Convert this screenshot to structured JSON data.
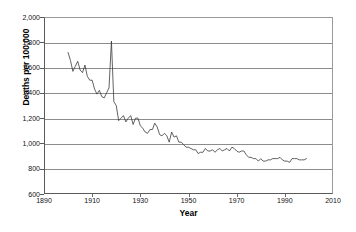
{
  "chart_data": {
    "type": "line",
    "title": "",
    "xlabel": "Year",
    "ylabel": "Deaths per 100,000",
    "xlim": [
      1890,
      2010
    ],
    "ylim": [
      600,
      2000
    ],
    "xticks": [
      1890,
      1910,
      1930,
      1950,
      1970,
      1990,
      2010
    ],
    "yticks": [
      600,
      800,
      1000,
      1200,
      1400,
      1600,
      1800,
      2000
    ],
    "ytick_labels": [
      "600",
      "800",
      "1,000",
      "1,200",
      "1,400",
      "1,600",
      "1,800",
      "2,000"
    ],
    "xtick_labels": [
      "1890",
      "1910",
      "1930",
      "1950",
      "1970",
      "1990",
      "2010"
    ],
    "grid": true,
    "grid_axis": "y",
    "legend": false,
    "legend_position": "none",
    "line_color": "#3a3a3a",
    "series": [
      {
        "name": "Deaths per 100,000",
        "x": [
          1900,
          1901,
          1902,
          1903,
          1904,
          1905,
          1906,
          1907,
          1908,
          1909,
          1910,
          1911,
          1912,
          1913,
          1914,
          1915,
          1916,
          1917,
          1918,
          1919,
          1920,
          1921,
          1922,
          1923,
          1924,
          1925,
          1926,
          1927,
          1928,
          1929,
          1930,
          1931,
          1932,
          1933,
          1934,
          1935,
          1936,
          1937,
          1938,
          1939,
          1940,
          1941,
          1942,
          1943,
          1944,
          1945,
          1946,
          1947,
          1948,
          1949,
          1950,
          1951,
          1952,
          1953,
          1954,
          1955,
          1956,
          1957,
          1958,
          1959,
          1960,
          1961,
          1962,
          1963,
          1964,
          1965,
          1966,
          1967,
          1968,
          1969,
          1970,
          1971,
          1972,
          1973,
          1974,
          1975,
          1976,
          1977,
          1978,
          1979,
          1980,
          1981,
          1982,
          1983,
          1984,
          1985,
          1986,
          1987,
          1988,
          1989,
          1990,
          1991,
          1992,
          1993,
          1994,
          1995,
          1996,
          1997,
          1998,
          1999
        ],
        "values": [
          1719,
          1655,
          1570,
          1610,
          1650,
          1580,
          1560,
          1620,
          1530,
          1500,
          1500,
          1430,
          1390,
          1420,
          1370,
          1360,
          1400,
          1440,
          1810,
          1330,
          1300,
          1180,
          1200,
          1220,
          1170,
          1200,
          1220,
          1150,
          1200,
          1200,
          1140,
          1120,
          1090,
          1080,
          1110,
          1110,
          1160,
          1130,
          1070,
          1060,
          1080,
          1060,
          1010,
          1090,
          1050,
          1060,
          1010,
          1010,
          990,
          970,
          970,
          960,
          950,
          950,
          920,
          930,
          930,
          960,
          940,
          940,
          950,
          930,
          950,
          960,
          940,
          950,
          960,
          940,
          970,
          960,
          940,
          930,
          940,
          940,
          910,
          890,
          890,
          880,
          880,
          860,
          880,
          860,
          860,
          870,
          870,
          880,
          880,
          880,
          890,
          870,
          860,
          860,
          850,
          880,
          880,
          880,
          870,
          870,
          870,
          880
        ]
      }
    ]
  }
}
